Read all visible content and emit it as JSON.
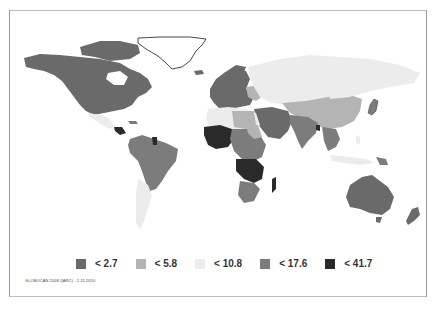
{
  "map": {
    "type": "choropleth",
    "region": "world",
    "colors": {
      "c1": "#6a6a6a",
      "c2": "#b4b4b4",
      "c3": "#ececec",
      "c4": "#7c7c7c",
      "c5": "#2a2a2a",
      "outline": "#1a1a1a"
    }
  },
  "legend": {
    "items": [
      {
        "label": "< 2.7",
        "color": "#6a6a6a"
      },
      {
        "label": "< 5.8",
        "color": "#b4b4b4"
      },
      {
        "label": "< 10.8",
        "color": "#ececec"
      },
      {
        "label": "< 17.6",
        "color": "#7c7c7c"
      },
      {
        "label": "< 41.7",
        "color": "#2a2a2a"
      }
    ]
  },
  "source": {
    "text": "GLOBOCAN 2008 (IARC) - 2.11.2010"
  }
}
